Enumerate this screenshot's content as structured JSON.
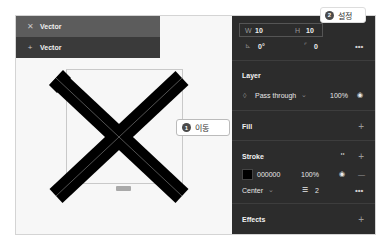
{
  "layers": [
    {
      "icon": "vector-x-icon",
      "glyph": "✕",
      "label": "Vector",
      "selected": true
    },
    {
      "icon": "vector-plus-icon",
      "glyph": "+",
      "label": "Vector",
      "selected": false
    }
  ],
  "canvas": {
    "size_label": "10×10",
    "callout_move": {
      "number": "1",
      "label": "이동"
    }
  },
  "properties": {
    "width_label": "W",
    "width_value": "10",
    "height_label": "H",
    "height_value": "10",
    "rotation_value": "0°",
    "radius_value": "0",
    "more_glyph": "•••",
    "callout_set": {
      "number": "2",
      "label": "설정"
    }
  },
  "layer_section": {
    "title": "Layer",
    "blend_mode": "Pass through",
    "opacity": "100%"
  },
  "fill_section": {
    "title": "Fill"
  },
  "stroke_section": {
    "title": "Stroke",
    "color_hex": "000000",
    "color_swatch": "#000000",
    "opacity": "100%",
    "position": "Center",
    "weight": "2"
  },
  "effects_section": {
    "title": "Effects"
  },
  "colors": {
    "panel_bg": "#2c2c2c",
    "layer_selected": "#5c5c5c",
    "layer_row": "#3a3a3a",
    "canvas_bg": "#f7f7f7"
  }
}
